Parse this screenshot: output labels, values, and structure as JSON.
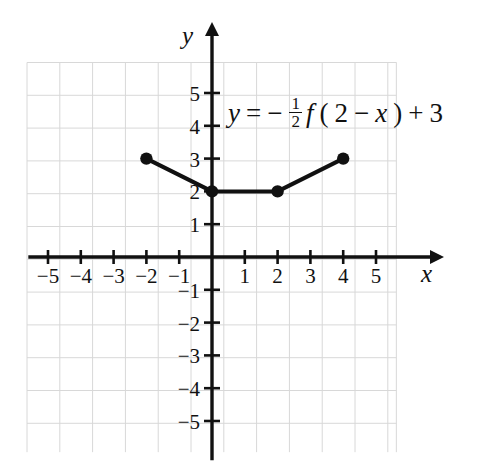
{
  "figure": {
    "kind": "cartesian-graph",
    "equation": {
      "lhs": "y",
      "eq_sign": "=",
      "minus": "−",
      "frac_num": "1",
      "frac_den": "2",
      "func": "f",
      "open_paren": "(",
      "inner_a": "2",
      "inner_minus": "−",
      "inner_var": "x",
      "close_paren": ")",
      "plus": "+",
      "constant": "3",
      "full_text": "y = −½f(2 − x) + 3"
    },
    "axis_labels": {
      "x": "x",
      "y": "y"
    },
    "colors": {
      "grid": "#d8d8d8",
      "axis": "#111111",
      "curve": "#111111",
      "point": "#111111",
      "background": "#ffffff"
    }
  },
  "chart_data": {
    "type": "line",
    "title": "",
    "xlabel": "x",
    "ylabel": "y",
    "xlim": [
      -5.6,
      5.6
    ],
    "ylim": [
      -5.9,
      6.1
    ],
    "grid": true,
    "legend": false,
    "xticks": [
      -5,
      -4,
      -3,
      -2,
      -1,
      1,
      2,
      3,
      4,
      5
    ],
    "yticks": [
      -5,
      -4,
      -3,
      -2,
      -1,
      1,
      2,
      3,
      4,
      5
    ],
    "xtick_labels": [
      "−5",
      "−4",
      "−3",
      "−2",
      "−1",
      "1",
      "2",
      "3",
      "4",
      "5"
    ],
    "ytick_labels": [
      "−5",
      "−4",
      "−3",
      "−2",
      "−1",
      "1",
      "2",
      "3",
      "4",
      "5"
    ],
    "series": [
      {
        "name": "y = −(1/2)f(2 − x) + 3",
        "x": [
          -2,
          0,
          2,
          4
        ],
        "values": [
          3,
          2,
          2,
          3
        ],
        "marker": "filled-circle",
        "linewidth": 4
      }
    ],
    "annotations": [
      {
        "text": "y = −½f(2 − x) + 3",
        "x": 0.6,
        "y": 4
      }
    ]
  }
}
